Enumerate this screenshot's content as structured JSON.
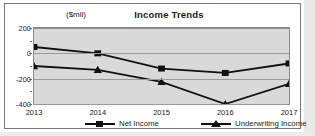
{
  "chart_data": {
    "type": "line",
    "title": "Income Trends",
    "unit_label": "($mil)",
    "xlabel": "",
    "ylabel": "($mil)",
    "categories": [
      "2013",
      "2014",
      "2015",
      "2016",
      "2017"
    ],
    "ylim": [
      -400,
      200
    ],
    "yticks": [
      200,
      0,
      -200,
      -400
    ],
    "ytick_labels": [
      "200",
      "0",
      "-200",
      "-400"
    ],
    "grid": true,
    "legend_position": "bottom",
    "series": [
      {
        "name": "Underwriting Income",
        "marker": "triangle",
        "color": "#111111",
        "values": [
          -100,
          -130,
          -225,
          -400,
          -240
        ]
      },
      {
        "name": "Net Income",
        "marker": "square",
        "color": "#111111",
        "values": [
          50,
          0,
          -120,
          -155,
          -80
        ]
      }
    ]
  },
  "legend": {
    "items": [
      {
        "label": "Underwriting Income",
        "marker": "triangle"
      },
      {
        "label": "Net Income",
        "marker": "square"
      }
    ]
  }
}
